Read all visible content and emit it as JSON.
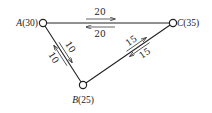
{
  "diagram": {
    "type": "network-flow",
    "nodes": [
      {
        "id": "A",
        "name": "A",
        "value": "(30)",
        "x": 43,
        "y": 23
      },
      {
        "id": "B",
        "name": "B",
        "value": "(25)",
        "x": 83,
        "y": 85
      },
      {
        "id": "C",
        "name": "C",
        "value": "(35)",
        "x": 173,
        "y": 23
      }
    ],
    "edges": [
      {
        "id": "AC",
        "from": "A",
        "to": "C",
        "forward_flow": "20",
        "backward_flow": "20"
      },
      {
        "id": "AB",
        "from": "A",
        "to": "B",
        "forward_flow": "10",
        "backward_flow": "10"
      },
      {
        "id": "BC",
        "from": "B",
        "to": "C",
        "forward_flow": "15",
        "backward_flow": "15"
      }
    ],
    "colors": {
      "line": "#222222",
      "node_fill": "#ffffff",
      "background": "#ffffff"
    }
  }
}
